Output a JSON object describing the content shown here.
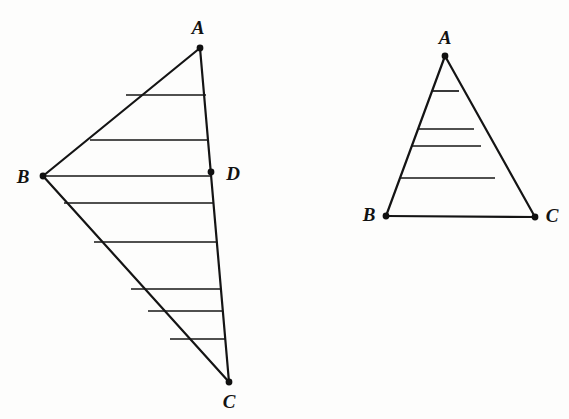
{
  "figure": {
    "background_color": "#fdfdfc",
    "ink_color": "#141414",
    "canvas": {
      "width": 569,
      "height": 419
    }
  },
  "chart_data": {
    "type": "diagram",
    "shapes": [
      {
        "name": "left-triangle",
        "kind": "triangle",
        "vertices": [
          {
            "label": "A",
            "x": 200,
            "y": 48,
            "label_x": 198,
            "label_y": 27,
            "dot": true
          },
          {
            "label": "B",
            "x": 43,
            "y": 176,
            "label_x": 23,
            "label_y": 176,
            "dot": true
          },
          {
            "label": "C",
            "x": 229,
            "y": 382,
            "label_x": 229,
            "label_y": 401,
            "dot": true
          }
        ],
        "extra_points": [
          {
            "label": "D",
            "x": 211,
            "y": 172,
            "label_x": 233,
            "label_y": 173,
            "dot": true,
            "on_segment": "A-C"
          }
        ],
        "edges": [
          {
            "from": "A",
            "to": "B",
            "width": 2.2
          },
          {
            "from": "B",
            "to": "C",
            "width": 2.2
          },
          {
            "from": "A",
            "to": "C",
            "width": 2.2
          }
        ],
        "hatch_lines": [
          {
            "x1": 126,
            "y1": 95,
            "x2": 206,
            "y2": 95
          },
          {
            "x1": 90,
            "y1": 140,
            "x2": 209,
            "y2": 140
          },
          {
            "x1": 43,
            "y1": 176,
            "x2": 211,
            "y2": 176
          },
          {
            "x1": 64,
            "y1": 203,
            "x2": 213,
            "y2": 203
          },
          {
            "x1": 94,
            "y1": 242,
            "x2": 217,
            "y2": 242
          },
          {
            "x1": 131,
            "y1": 289,
            "x2": 221,
            "y2": 289
          },
          {
            "x1": 148,
            "y1": 311,
            "x2": 223,
            "y2": 311
          },
          {
            "x1": 170,
            "y1": 339,
            "x2": 225,
            "y2": 339
          }
        ],
        "hatch_width": 1.7
      },
      {
        "name": "right-triangle",
        "kind": "triangle",
        "vertices": [
          {
            "label": "A",
            "x": 445,
            "y": 56,
            "label_x": 445,
            "label_y": 37,
            "dot": true
          },
          {
            "label": "B",
            "x": 386,
            "y": 216,
            "label_x": 369,
            "label_y": 214,
            "dot": true
          },
          {
            "label": "C",
            "x": 535,
            "y": 217,
            "label_x": 552,
            "label_y": 215,
            "dot": true
          }
        ],
        "extra_points": [],
        "edges": [
          {
            "from": "A",
            "to": "B",
            "width": 2.2
          },
          {
            "from": "B",
            "to": "C",
            "width": 2.2
          },
          {
            "from": "A",
            "to": "C",
            "width": 2.2
          }
        ],
        "hatch_lines": [
          {
            "x1": 432,
            "y1": 91,
            "x2": 459,
            "y2": 91
          },
          {
            "x1": 418,
            "y1": 129,
            "x2": 474,
            "y2": 129
          },
          {
            "x1": 412,
            "y1": 146,
            "x2": 481,
            "y2": 146
          },
          {
            "x1": 400,
            "y1": 178,
            "x2": 495,
            "y2": 178
          }
        ],
        "hatch_width": 1.7
      }
    ],
    "vertex_dot_radius": 3.4
  }
}
